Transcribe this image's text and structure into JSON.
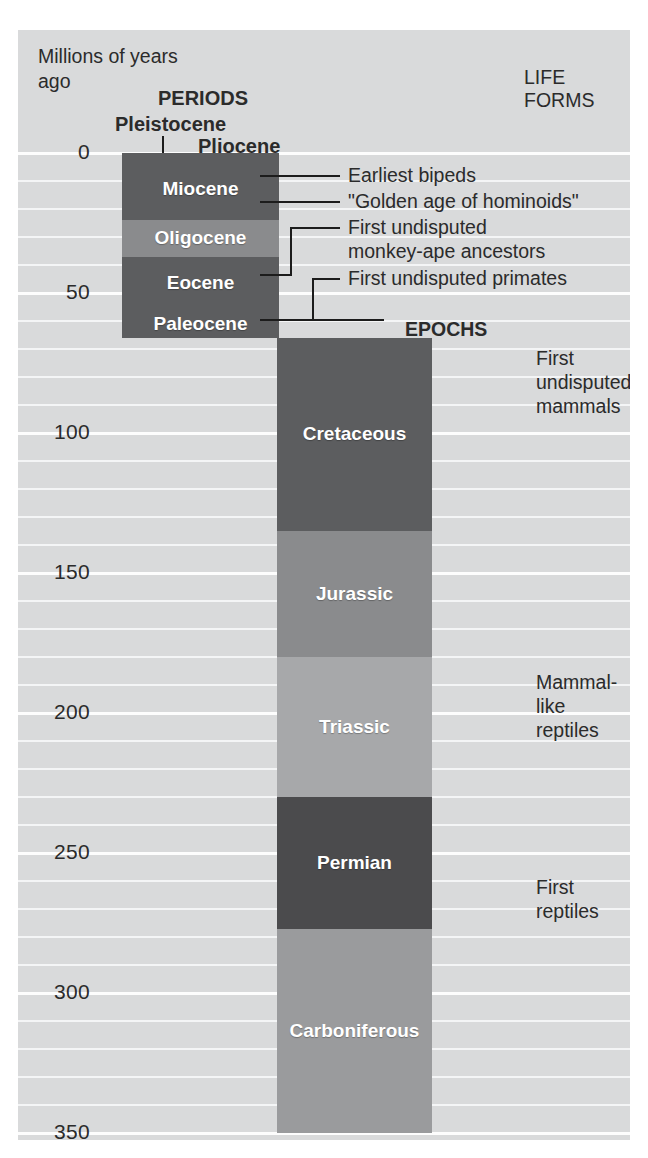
{
  "figure": {
    "axis_title": "Millions of\nyears ago",
    "life_forms_header": "LIFE FORMS",
    "periods_header": "PERIODS",
    "epochs_header": "EPOCHS",
    "top_epoch_labels": [
      {
        "name": "Pleistocene"
      },
      {
        "name": "Pliocene"
      }
    ]
  },
  "chart_data": {
    "type": "bar",
    "xlabel": "",
    "ylabel": "Millions of years ago",
    "ylim": [
      0,
      350
    ],
    "y_axis_inverted": true,
    "grid": true,
    "gridline_interval": 10,
    "tick_interval": 50,
    "tick_labels": [
      "0",
      "50",
      "100",
      "150",
      "200",
      "250",
      "300",
      "350"
    ],
    "tick_values": [
      0,
      50,
      100,
      150,
      200,
      250,
      300,
      350
    ],
    "legend": "none",
    "columns": [
      {
        "name": "EPOCHS",
        "bands": [
          {
            "label": "",
            "start": 0,
            "end": 2,
            "shade": "dark"
          },
          {
            "label": "Miocene",
            "start": 2,
            "end": 24,
            "shade": "dark"
          },
          {
            "label": "Oligocene",
            "start": 24,
            "end": 37,
            "shade": "medium"
          },
          {
            "label": "Eocene",
            "start": 37,
            "end": 56,
            "shade": "dark"
          },
          {
            "label": "Paleocene",
            "start": 56,
            "end": 66,
            "shade": "dark"
          }
        ]
      },
      {
        "name": "PERIODS",
        "bands": [
          {
            "label": "Cretaceous",
            "start": 66,
            "end": 135,
            "shade": "dark"
          },
          {
            "label": "Jurassic",
            "start": 135,
            "end": 180,
            "shade": "medium"
          },
          {
            "label": "Triassic",
            "start": 180,
            "end": 230,
            "shade": "light"
          },
          {
            "label": "Permian",
            "start": 230,
            "end": 277,
            "shade": "darkest"
          },
          {
            "label": "Carboniferous",
            "start": 277,
            "end": 350,
            "shade": "medium-light"
          }
        ]
      }
    ],
    "annotations": [
      {
        "text": "Earliest bipeds",
        "at_mya": 8
      },
      {
        "text": "\"Golden age of hominoids\"",
        "at_mya": 17
      },
      {
        "text": "First undisputed\nmonkey-ape ancestors",
        "at_mya": 45
      },
      {
        "text": "First undisputed primates",
        "at_mya": 60
      },
      {
        "text": "First undisputed\nmammals",
        "at_mya": 190
      },
      {
        "text": "Mammal-like\nreptiles",
        "at_mya": 252
      },
      {
        "text": "First reptiles",
        "at_mya": 310
      }
    ]
  },
  "colors": {
    "background": "#d9dadb",
    "gridline": "#f4f5f6",
    "band_darkest": "#4b4b4d",
    "band_dark": "#5c5d5f",
    "band_medium": "#8a8b8d",
    "band_medium_light": "#9a9b9d",
    "band_light": "#a7a8aa",
    "text": "#2b2b2b",
    "band_text": "#ffffff",
    "leader_line": "#1c1c1c"
  }
}
